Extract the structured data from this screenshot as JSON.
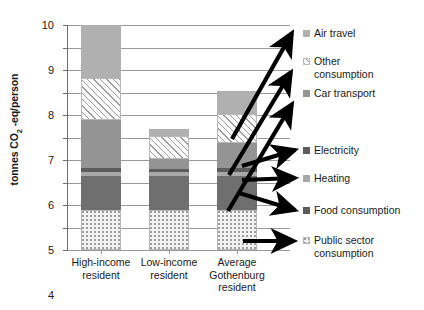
{
  "chart_data": {
    "type": "bar",
    "stacked": true,
    "title": "",
    "xlabel": "",
    "ylabel": "tonnes CO2 -eq/person",
    "ylim": [
      0,
      10
    ],
    "ytick_labels": [
      "0",
      "1",
      "2",
      "3",
      "4",
      "5",
      "6",
      "7",
      "8",
      "9",
      "10"
    ],
    "yticks": [
      0,
      1,
      2,
      3,
      4,
      5,
      6,
      7,
      8,
      9,
      10
    ],
    "grid": true,
    "legend_position": "right",
    "categories": [
      "High-income resident",
      "Low-income resident",
      "Average Gothenburg resident"
    ],
    "series": [
      {
        "name": "Public sector consumption",
        "values": [
          1.8,
          1.8,
          1.8
        ]
      },
      {
        "name": "Food consumption",
        "values": [
          1.5,
          1.5,
          1.5
        ]
      },
      {
        "name": "Heating",
        "values": [
          0.15,
          0.15,
          0.15
        ]
      },
      {
        "name": "Electricity",
        "values": [
          0.2,
          0.15,
          0.2
        ]
      },
      {
        "name": "Car transport",
        "values": [
          2.15,
          0.45,
          1.1
        ]
      },
      {
        "name": "Other consumption",
        "values": [
          1.85,
          1.0,
          1.3
        ]
      },
      {
        "name": "Air travel",
        "values": [
          2.35,
          0.35,
          1.0
        ]
      }
    ],
    "totals": [
      10.0,
      5.4,
      7.05
    ]
  },
  "axis": {
    "y_title_main": "tonnes CO",
    "y_title_sub": "2",
    "y_title_tail": " -eq/person"
  },
  "x_labels": [
    "High-income\nresident",
    "Low-income\nresident",
    "Average\nGothenburg\nresident"
  ],
  "legend": {
    "items": [
      {
        "label": "Air travel",
        "swatch": "light-gray-swatch"
      },
      {
        "label": "Other\nconsumption",
        "swatch": "hatched-swatch"
      },
      {
        "label": "Car transport",
        "swatch": "medium-gray-swatch"
      },
      {
        "label": "Electricity",
        "swatch": "dark-gray-swatch"
      },
      {
        "label": "Heating",
        "swatch": "mid-light-gray-swatch"
      },
      {
        "label": "Food consumption",
        "swatch": "dark-gray-swatch"
      },
      {
        "label": "Public sector\nconsumption",
        "swatch": "white-dotted-swatch"
      }
    ]
  },
  "colors": {
    "public_sector": "#f2f2f2",
    "food": "#6f6f6f",
    "heating": "#a8a8a8",
    "electricity": "#5c5c5c",
    "car_transport": "#949494",
    "other_consumption": "#fbfbfb",
    "air_travel": "#b0b0b0",
    "gridline": "#9a9a9a",
    "axis": "#6e6e6e",
    "arrow": "#000000",
    "text": "#1a1a1a"
  }
}
